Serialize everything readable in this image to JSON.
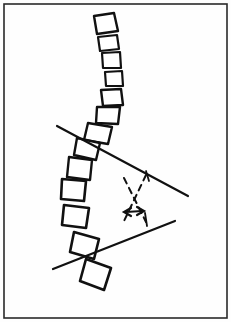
{
  "figure": {
    "background_color": "#fefefe",
    "ink_color": "#111111",
    "frame": {
      "x": 4,
      "y": 4,
      "width": 223,
      "height": 314,
      "stroke_width": 1.6,
      "color": "#2a2a2a"
    },
    "vertebrae": [
      {
        "id": "vertebra-1",
        "label": "T1",
        "points": "94,16 114,13 118,31 97,34",
        "stroke_width": 2.4
      },
      {
        "id": "vertebra-2",
        "label": "T2",
        "points": "98,37 117,35 119,49 100,51",
        "stroke_width": 2.2
      },
      {
        "id": "vertebra-3",
        "label": "T3",
        "points": "102,53 120,52 121,68 103,68",
        "stroke_width": 2.2
      },
      {
        "id": "vertebra-4",
        "label": "T4",
        "points": "105,72 122,71 123,86 106,86",
        "stroke_width": 2.2
      },
      {
        "id": "vertebra-5",
        "label": "T5",
        "points": "101,90 121,89 123,105 103,106",
        "stroke_width": 2.4
      },
      {
        "id": "vertebra-6",
        "label": "T6",
        "points": "97,107 120,107 118,124 96,123",
        "stroke_width": 2.4
      },
      {
        "id": "vertebra-7",
        "label": "T7",
        "points": "88,123 112,127 108,144 84,140",
        "stroke_width": 2.4
      },
      {
        "id": "vertebra-8",
        "label": "T8",
        "points": "77,138 100,143 96,160 74,155",
        "stroke_width": 2.4
      },
      {
        "id": "vertebra-9",
        "label": "T9",
        "points": "69,157 92,160 90,180 67,177",
        "stroke_width": 2.4
      },
      {
        "id": "vertebra-10",
        "label": "T10",
        "points": "62,179 86,181 84,201 61,199",
        "stroke_width": 2.6
      },
      {
        "id": "vertebra-11",
        "label": "T11",
        "points": "64,205 89,208 86,228 62,225",
        "stroke_width": 2.6
      },
      {
        "id": "vertebra-12",
        "label": "T12",
        "points": "74,232 99,239 94,259 70,252",
        "stroke_width": 2.6
      },
      {
        "id": "vertebra-13",
        "label": "L1",
        "points": "86,259 111,268 104,290 80,281",
        "stroke_width": 2.6
      }
    ],
    "endplate_lines": [
      {
        "id": "upper-endplate-line",
        "label": "Upper end vertebra endplate line",
        "x1": 57,
        "y1": 126,
        "x2": 188,
        "y2": 196,
        "stroke_width": 2.2
      },
      {
        "id": "lower-endplate-line",
        "label": "Lower end vertebra endplate line",
        "x1": 53,
        "y1": 269,
        "x2": 175,
        "y2": 221,
        "stroke_width": 2.2
      }
    ],
    "tick_marks": [
      {
        "id": "upper-tick",
        "x1": 146,
        "y1": 171,
        "x2": 149,
        "y2": 181,
        "stroke_width": 1.8
      },
      {
        "id": "lower-tick",
        "x1": 145,
        "y1": 213,
        "x2": 147,
        "y2": 226,
        "stroke_width": 1.8
      }
    ],
    "perpendiculars": [
      {
        "id": "perpendicular-from-upper-line",
        "label": "Perpendicular to upper endplate line",
        "x1": 146,
        "y1": 175,
        "x2": 124,
        "y2": 221,
        "stroke_width": 2.0,
        "dash": "6,5"
      },
      {
        "id": "perpendicular-from-lower-line",
        "label": "Perpendicular to lower endplate line",
        "x1": 124,
        "y1": 178,
        "x2": 146,
        "y2": 222,
        "stroke_width": 2.0,
        "dash": "6,5"
      }
    ],
    "angle_marker": {
      "id": "cobb-angle-arrow",
      "label": "Cobb angle double-headed arrow",
      "shaft": {
        "x1": 126,
        "y1": 212,
        "x2": 142,
        "y2": 211
      },
      "head_left": "131,208 124,212 131,216",
      "head_right": "137,207 144,211 137,215",
      "stroke_width": 2.2
    }
  }
}
